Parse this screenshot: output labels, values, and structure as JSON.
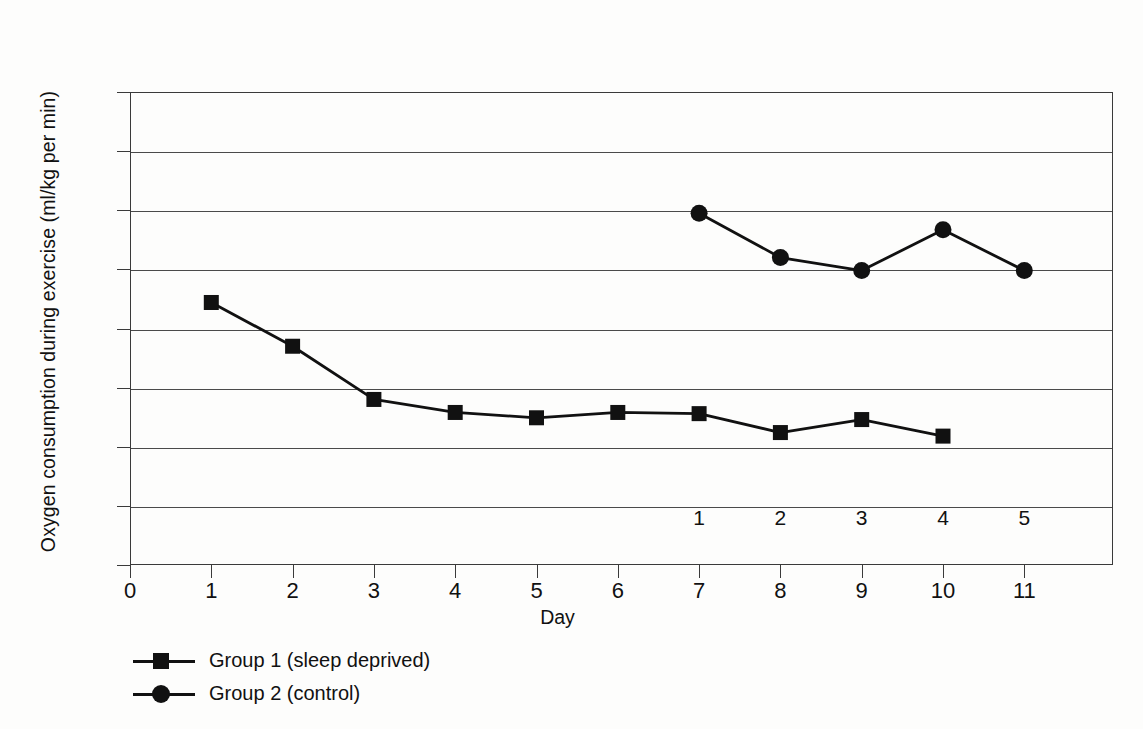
{
  "chart_data": {
    "type": "line",
    "title": "",
    "xlabel": "Day",
    "ylabel": "Oxygen consumption during exercise (ml/kg per min)",
    "xlim": [
      0,
      12.1
    ],
    "ylim": [
      0,
      80
    ],
    "grid": true,
    "legend_position": "below-left",
    "x_ticks": [
      "0",
      "1",
      "2",
      "3",
      "4",
      "5",
      "6",
      "7",
      "8",
      "9",
      "10",
      "11"
    ],
    "x_tick_values": [
      0,
      1,
      2,
      3,
      4,
      5,
      6,
      7,
      8,
      9,
      10,
      11
    ],
    "y_ticks": [
      "0",
      "10",
      "20",
      "30",
      "40",
      "50",
      "60",
      "70",
      "80"
    ],
    "y_tick_values": [
      0,
      10,
      20,
      30,
      40,
      50,
      60,
      70,
      80
    ],
    "secondary_x_ticks": [
      {
        "label": "1",
        "at_day": 7
      },
      {
        "label": "2",
        "at_day": 8
      },
      {
        "label": "3",
        "at_day": 9
      },
      {
        "label": "4",
        "at_day": 10
      },
      {
        "label": "5",
        "at_day": 11
      }
    ],
    "series": [
      {
        "name": "Group 1 (sleep deprived)",
        "marker": "square",
        "color": "#111111",
        "x": [
          1,
          2,
          3,
          4,
          5,
          6,
          7,
          8,
          9,
          10
        ],
        "values": [
          44.4,
          37.0,
          28.0,
          25.8,
          24.9,
          25.8,
          25.6,
          22.4,
          24.6,
          21.8
        ]
      },
      {
        "name": "Group 2 (control)",
        "marker": "circle",
        "color": "#111111",
        "x": [
          7,
          8,
          9,
          10,
          11
        ],
        "values": [
          59.5,
          52.0,
          49.8,
          56.7,
          49.8
        ]
      }
    ]
  },
  "legend": {
    "items": [
      {
        "label": "Group 1 (sleep deprived)",
        "marker": "square"
      },
      {
        "label": "Group 2 (control)",
        "marker": "circle"
      }
    ]
  },
  "colors": {
    "ink": "#111111",
    "axis": "#3a3a3a",
    "grid": "#4a4a4a",
    "background": "#fdfdfc"
  }
}
